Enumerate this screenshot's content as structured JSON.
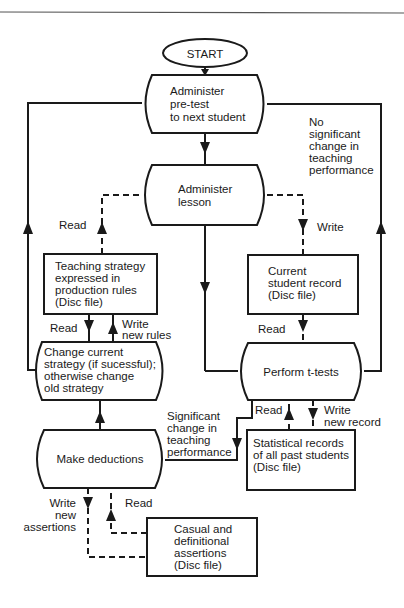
{
  "diagram": {
    "type": "flowchart",
    "nodes": {
      "start": {
        "label": "START",
        "shape": "ellipse"
      },
      "pretest": {
        "lines": [
          "Administer",
          "pre-test",
          "to next student"
        ],
        "shape": "process"
      },
      "lesson": {
        "lines": [
          "Administer",
          "lesson"
        ],
        "shape": "process"
      },
      "strategy_file": {
        "lines": [
          "Teaching strategy",
          "expressed in",
          "production rules",
          "(Disc file)"
        ],
        "shape": "file"
      },
      "student_record": {
        "lines": [
          "Current",
          "student record",
          "(Disc file)"
        ],
        "shape": "file"
      },
      "change_strategy": {
        "lines": [
          "Change current",
          "strategy (if sucessful);",
          "otherwise change",
          "old strategy"
        ],
        "shape": "process"
      },
      "ttests": {
        "lines": [
          "Perform t-tests"
        ],
        "shape": "process"
      },
      "deductions": {
        "lines": [
          "Make deductions"
        ],
        "shape": "process"
      },
      "statistical_file": {
        "lines": [
          "Statistical records",
          "of all past students",
          "(Disc file)"
        ],
        "shape": "file"
      },
      "assertions_file": {
        "lines": [
          "Casual and",
          "definitional",
          "assertions",
          "(Disc file)"
        ],
        "shape": "file"
      }
    },
    "edge_labels": {
      "no_change": [
        "No",
        "significant",
        "change in",
        "teaching",
        "performance"
      ],
      "significant": [
        "Significant",
        "change in",
        "teaching",
        "performance"
      ],
      "read_strategy": "Read",
      "write_record": "Write",
      "read_rules": "Read",
      "write_rules": [
        "Write",
        "new rules"
      ],
      "read_record": "Read",
      "read_stats": "Read",
      "write_stats": [
        "Write",
        "new record"
      ],
      "write_assertions": [
        "Write",
        "new",
        "assertions"
      ],
      "read_assertions": "Read"
    },
    "edges": [
      {
        "from": "start",
        "to": "pretest",
        "style": "solid"
      },
      {
        "from": "pretest",
        "to": "lesson",
        "style": "solid"
      },
      {
        "from": "lesson",
        "to": "ttests",
        "style": "solid"
      },
      {
        "from": "strategy_file",
        "to": "lesson",
        "style": "dashed",
        "label": "Read"
      },
      {
        "from": "lesson",
        "to": "student_record",
        "style": "dashed",
        "label": "Write"
      },
      {
        "from": "strategy_file",
        "to": "change_strategy",
        "style": "solid",
        "label": "Read"
      },
      {
        "from": "change_strategy",
        "to": "strategy_file",
        "style": "solid",
        "label": "Write new rules"
      },
      {
        "from": "student_record",
        "to": "ttests",
        "style": "dashed",
        "label": "Read"
      },
      {
        "from": "ttests",
        "to": "pretest",
        "style": "solid",
        "label": "No significant change in teaching performance"
      },
      {
        "from": "ttests",
        "to": "deductions",
        "style": "solid",
        "label": "Significant change in teaching performance"
      },
      {
        "from": "statistical_file",
        "to": "ttests",
        "style": "dashed",
        "label": "Read"
      },
      {
        "from": "ttests",
        "to": "statistical_file",
        "style": "dashed",
        "label": "Write new record"
      },
      {
        "from": "deductions",
        "to": "change_strategy",
        "style": "solid"
      },
      {
        "from": "change_strategy",
        "to": "pretest",
        "style": "solid"
      },
      {
        "from": "deductions",
        "to": "assertions_file",
        "style": "dashed",
        "label": "Write new assertions"
      },
      {
        "from": "assertions_file",
        "to": "deductions",
        "style": "dashed",
        "label": "Read"
      }
    ]
  }
}
